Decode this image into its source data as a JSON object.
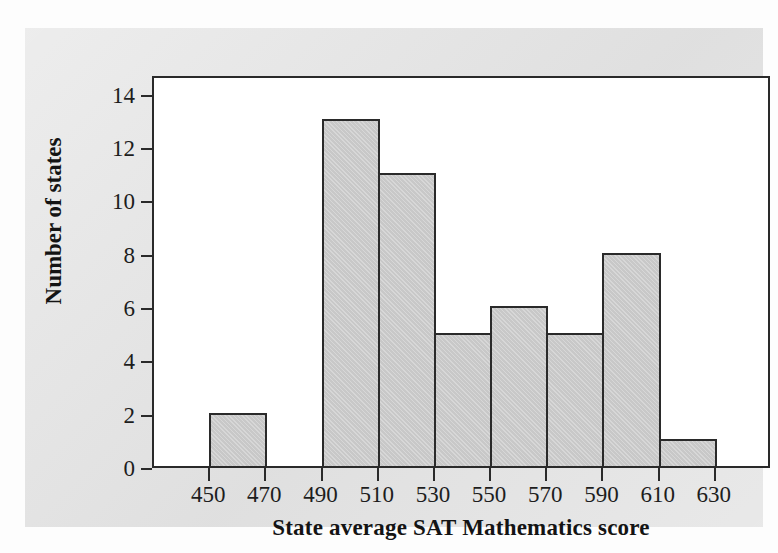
{
  "figure": {
    "panel_background": "#e3e3e3",
    "plot_background": "#ffffff",
    "axis_color": "#2a2a2a",
    "bar_fill": "#c8c8c8"
  },
  "chart_data": {
    "type": "bar",
    "title": "",
    "xlabel": "State average SAT Mathematics score",
    "ylabel": "Number of states",
    "categories": [
      "450-470",
      "470-490",
      "490-510",
      "510-530",
      "530-550",
      "550-570",
      "570-590",
      "590-610",
      "610-630"
    ],
    "bin_edges": [
      450,
      470,
      490,
      510,
      530,
      550,
      570,
      590,
      610,
      630
    ],
    "bin_width": 20,
    "values": [
      2,
      0,
      13,
      11,
      5,
      6,
      5,
      8,
      1
    ],
    "bars": [
      {
        "bin_start": 450,
        "bin_end": 470,
        "value": 2
      },
      {
        "bin_start": 470,
        "bin_end": 490,
        "value": 0
      },
      {
        "bin_start": 490,
        "bin_end": 510,
        "value": 13
      },
      {
        "bin_start": 510,
        "bin_end": 530,
        "value": 11
      },
      {
        "bin_start": 530,
        "bin_end": 550,
        "value": 5
      },
      {
        "bin_start": 550,
        "bin_end": 570,
        "value": 6
      },
      {
        "bin_start": 570,
        "bin_end": 590,
        "value": 5
      },
      {
        "bin_start": 590,
        "bin_end": 610,
        "value": 8
      },
      {
        "bin_start": 610,
        "bin_end": 630,
        "value": 1
      }
    ],
    "xlim": [
      430,
      650
    ],
    "ylim": [
      0,
      14.7
    ],
    "xticks": [
      450,
      470,
      490,
      510,
      530,
      550,
      570,
      590,
      610,
      630
    ],
    "xtick_labels": [
      "450",
      "470",
      "490",
      "510",
      "530",
      "550",
      "570",
      "590",
      "610",
      "630"
    ],
    "yticks": [
      0,
      2,
      4,
      6,
      8,
      10,
      12,
      14
    ],
    "ytick_labels": [
      "0",
      "2",
      "4",
      "6",
      "8",
      "10",
      "12",
      "14"
    ],
    "grid": false,
    "legend": null,
    "total_states": 51
  }
}
